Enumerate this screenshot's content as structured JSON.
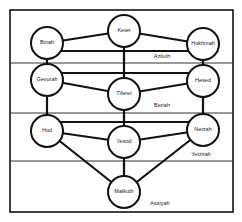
{
  "diagram": {
    "nodes": [
      {
        "id": "keter",
        "label": "Keter",
        "x": 124,
        "y": 31
      },
      {
        "id": "binah",
        "label": "Binah",
        "x": 47,
        "y": 43
      },
      {
        "id": "hokhmah",
        "label": "Hokhmah",
        "x": 203,
        "y": 44
      },
      {
        "id": "gevurah",
        "label": "Gevurah",
        "x": 47,
        "y": 80
      },
      {
        "id": "hesed",
        "label": "Hesed",
        "x": 203,
        "y": 81
      },
      {
        "id": "tiferet",
        "label": "Tiferet",
        "x": 124,
        "y": 94
      },
      {
        "id": "hod",
        "label": "Hod",
        "x": 47,
        "y": 131
      },
      {
        "id": "netzah",
        "label": "Netzah",
        "x": 203,
        "y": 130
      },
      {
        "id": "yesod",
        "label": "Yesod",
        "x": 124,
        "y": 142
      },
      {
        "id": "malkuth",
        "label": "Malkuth",
        "x": 124,
        "y": 192
      }
    ],
    "worlds": [
      {
        "id": "aziluth",
        "label": "Aziluth",
        "x": 162,
        "y": 57
      },
      {
        "id": "beriah",
        "label": "Beriah",
        "x": 162,
        "y": 106
      },
      {
        "id": "yetzirah",
        "label": "Yetzirah",
        "x": 201,
        "y": 155
      },
      {
        "id": "assiyah",
        "label": "Assiyah",
        "x": 160,
        "y": 204
      }
    ],
    "dividers_y": [
      63,
      113,
      161
    ],
    "node_radius": 16
  }
}
